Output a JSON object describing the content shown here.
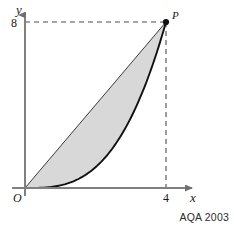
{
  "figure": {
    "background_color": "#ffffff",
    "caption": "AQA 2003",
    "axes": {
      "x_axis_label": "x",
      "y_axis_label": "y",
      "origin_label": "O",
      "axis_color": "#808080",
      "x_ticks": [
        {
          "value": 4,
          "label": "4"
        }
      ],
      "y_ticks": [
        {
          "value": 8,
          "label": "8"
        }
      ],
      "x_range": [
        0,
        4.65
      ],
      "y_range": [
        0,
        9.0
      ],
      "grid": false
    },
    "points": [
      {
        "name": "P",
        "label": "P",
        "x": 4,
        "y": 8,
        "marker": "filled-dot",
        "color": "#111111"
      }
    ],
    "guides": [
      {
        "name": "horizontal-dashed-to-P",
        "style": "dashed",
        "from": [
          0,
          8
        ],
        "to": [
          4,
          8
        ],
        "color": "#4d4d4d"
      },
      {
        "name": "vertical-dashed-to-P",
        "style": "dashed",
        "from": [
          4,
          8
        ],
        "to": [
          4,
          0
        ],
        "color": "#4d4d4d"
      }
    ],
    "curves": [
      {
        "name": "cubic-curve",
        "expression": "y = x^3 / 8",
        "style": "solid",
        "stroke_width": 1.9,
        "color": "#111111",
        "from": [
          0,
          0
        ],
        "to": [
          4,
          8
        ]
      },
      {
        "name": "chord-line",
        "expression": "y = 2x",
        "style": "solid",
        "stroke_width": 1.0,
        "color": "#3a3a3a",
        "from": [
          0,
          0
        ],
        "to": [
          4,
          8
        ]
      }
    ],
    "shaded_region": {
      "name": "area-between-line-and-curve",
      "fill_color": "#d8d8d8",
      "upper_boundary": "chord-line",
      "lower_boundary": "cubic-curve",
      "x_from": 0,
      "x_to": 4
    }
  },
  "chart_data": {
    "type": "line",
    "title": "",
    "xlabel": "x",
    "ylabel": "y",
    "xlim": [
      0,
      4.65
    ],
    "ylim": [
      0,
      9.0
    ],
    "grid": false,
    "legend": "none",
    "xticks": [
      4
    ],
    "xticklabels": [
      "4"
    ],
    "yticks": [
      8
    ],
    "yticklabels": [
      "8"
    ],
    "annotations": [
      {
        "text": "P",
        "x": 4,
        "y": 8
      },
      {
        "text": "O",
        "x": 0,
        "y": 0
      }
    ],
    "series": [
      {
        "name": "y = x^3 / 8",
        "x": [
          0,
          0.4,
          0.8,
          1.2,
          1.6,
          2.0,
          2.4,
          2.8,
          3.2,
          3.6,
          4.0
        ],
        "values": [
          0,
          0.008,
          0.064,
          0.216,
          0.512,
          1.0,
          1.728,
          2.744,
          4.096,
          5.832,
          8.0
        ]
      },
      {
        "name": "y = 2x",
        "x": [
          0,
          0.4,
          0.8,
          1.2,
          1.6,
          2.0,
          2.4,
          2.8,
          3.2,
          3.6,
          4.0
        ],
        "values": [
          0,
          0.8,
          1.6,
          2.4,
          3.2,
          4.0,
          4.8,
          5.6,
          6.4,
          7.2,
          8.0
        ]
      }
    ]
  }
}
